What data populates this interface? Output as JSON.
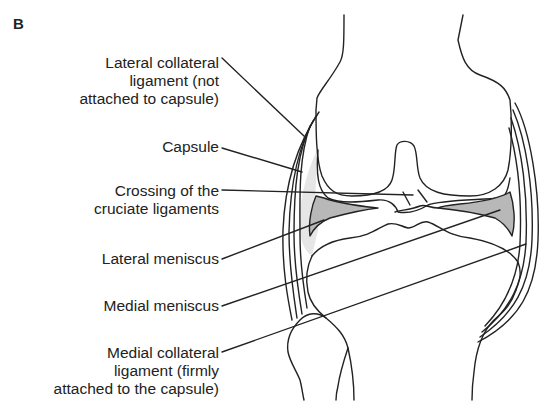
{
  "figure": {
    "panel_label": "B",
    "labels": [
      {
        "id": "lateral-collateral-ligament",
        "lines": [
          "Lateral collateral",
          "ligament (not",
          "attached to capsule)"
        ]
      },
      {
        "id": "capsule",
        "lines": [
          "Capsule"
        ]
      },
      {
        "id": "crossing-cruciate",
        "lines": [
          "Crossing of the",
          "cruciate ligaments"
        ]
      },
      {
        "id": "lateral-meniscus",
        "lines": [
          "Lateral meniscus"
        ]
      },
      {
        "id": "medial-meniscus",
        "lines": [
          "Medial meniscus"
        ]
      },
      {
        "id": "medial-collateral-ligament",
        "lines": [
          "Medial collateral",
          "ligament (firmly",
          "attached to the capsule)"
        ]
      }
    ],
    "colors": {
      "line": "#222222",
      "capsule_fill": "#e6e6e6",
      "meniscus_fill": "#b8b8b8"
    }
  }
}
